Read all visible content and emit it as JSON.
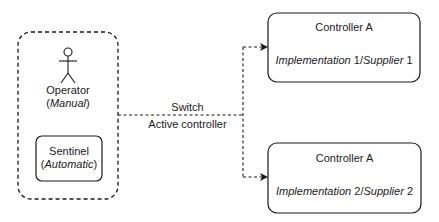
{
  "operator_group": {
    "operator": {
      "name": "Operator",
      "mode": "Manual",
      "icon": "actor-icon"
    },
    "sentinel": {
      "name": "Sentinel",
      "mode": "Automatic"
    }
  },
  "connector": {
    "label_top": "Switch",
    "label_bottom": "Active controller"
  },
  "controllers": [
    {
      "title": "Controller A",
      "impl_word": "Implementation",
      "impl_num": "1",
      "supplier_word": "Supplier",
      "supplier_num": "1"
    },
    {
      "title": "Controller A",
      "impl_word": "Implementation",
      "impl_num": "2",
      "supplier_word": "Supplier",
      "supplier_num": "2"
    }
  ],
  "colors": {
    "stroke": "#1a1a1a",
    "background": "#ffffff"
  }
}
